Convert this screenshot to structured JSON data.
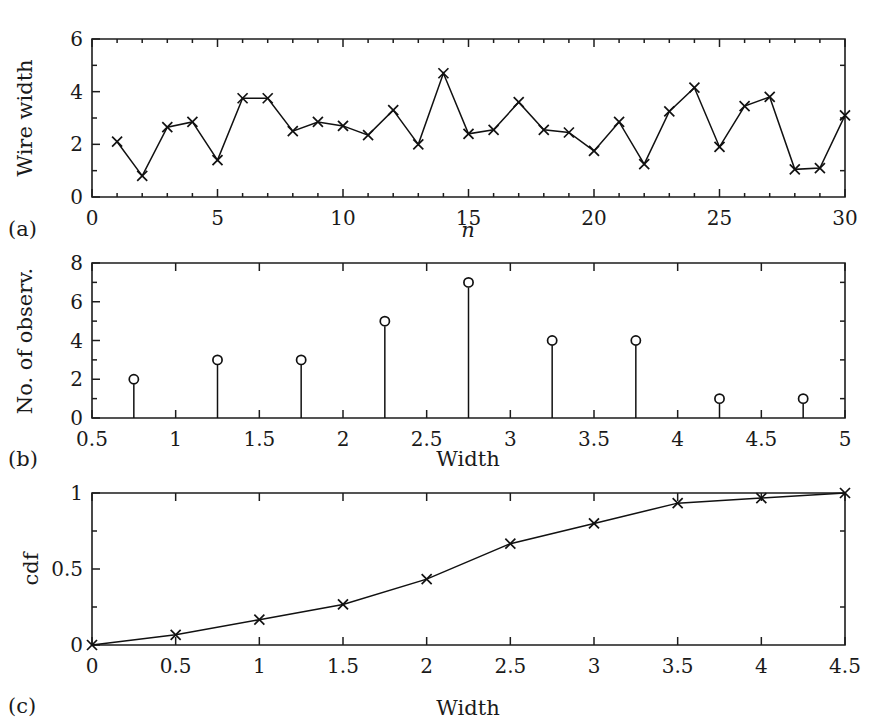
{
  "figure": {
    "title": "",
    "background_color": "#ffffff",
    "line_color": "#111111",
    "axis_color": "#1d1d1d",
    "text_color": "#1a1a1a",
    "panels": [
      {
        "key": "a",
        "label": "(a)"
      },
      {
        "key": "b",
        "label": "(b)"
      },
      {
        "key": "c",
        "label": "(c)"
      }
    ]
  },
  "chart_data": [
    {
      "panel": "a",
      "panel_label": "(a)",
      "type": "line",
      "title": "",
      "xlabel": "n",
      "ylabel": "Wire width",
      "xlim": [
        0,
        30
      ],
      "ylim": [
        0,
        6
      ],
      "xticks": [
        0,
        5,
        10,
        15,
        20,
        25,
        30
      ],
      "xtick_labels": [
        "0",
        "5",
        "10",
        "15",
        "20",
        "25",
        "30"
      ],
      "xminor_step": 1,
      "yticks": [
        0,
        2,
        4,
        6
      ],
      "ytick_labels": [
        "0",
        "2",
        "4",
        "6"
      ],
      "grid": false,
      "legend": false,
      "marker": "x",
      "x": [
        1,
        2,
        3,
        4,
        5,
        6,
        7,
        8,
        9,
        10,
        11,
        12,
        13,
        14,
        15,
        16,
        17,
        18,
        19,
        20,
        21,
        22,
        23,
        24,
        25,
        26,
        27,
        28,
        29,
        30
      ],
      "values": [
        2.1,
        0.8,
        2.65,
        2.85,
        1.4,
        3.75,
        3.75,
        2.5,
        2.85,
        2.7,
        2.35,
        3.3,
        2.0,
        4.7,
        2.4,
        2.55,
        3.6,
        2.55,
        2.45,
        1.75,
        2.85,
        1.25,
        3.25,
        4.15,
        1.9,
        3.45,
        3.8,
        1.05,
        1.1,
        3.1
      ]
    },
    {
      "panel": "b",
      "panel_label": "(b)",
      "type": "bar",
      "subtype": "stem",
      "title": "",
      "xlabel": "Width",
      "ylabel": "No. of observ.",
      "xlim": [
        0.5,
        5
      ],
      "ylim": [
        0,
        8
      ],
      "xticks": [
        0.5,
        1,
        1.5,
        2,
        2.5,
        3,
        3.5,
        4,
        4.5,
        5
      ],
      "xtick_labels": [
        "0.5",
        "1",
        "1.5",
        "2",
        "2.5",
        "3",
        "3.5",
        "4",
        "4.5",
        "5"
      ],
      "yticks": [
        0,
        2,
        4,
        6,
        8
      ],
      "ytick_labels": [
        "0",
        "2",
        "4",
        "6",
        "8"
      ],
      "grid": false,
      "legend": false,
      "marker": "o",
      "categories": [
        0.75,
        1.25,
        1.75,
        2.25,
        2.75,
        3.25,
        3.75,
        4.25,
        4.75
      ],
      "values": [
        2,
        3,
        3,
        5,
        7,
        4,
        4,
        1,
        1
      ]
    },
    {
      "panel": "c",
      "panel_label": "(c)",
      "type": "line",
      "subtype": "cdf",
      "title": "",
      "xlabel": "Width",
      "ylabel": "cdf",
      "xlim": [
        0,
        4.5
      ],
      "ylim": [
        0,
        1
      ],
      "xticks": [
        0,
        0.5,
        1,
        1.5,
        2,
        2.5,
        3,
        3.5,
        4,
        4.5
      ],
      "xtick_labels": [
        "0",
        "0.5",
        "1",
        "1.5",
        "2",
        "2.5",
        "3",
        "3.5",
        "4",
        "4.5"
      ],
      "yticks": [
        0,
        0.5,
        1
      ],
      "ytick_labels": [
        "0",
        "0.5",
        "1"
      ],
      "grid": false,
      "legend": false,
      "marker": "x",
      "x": [
        0,
        0.5,
        1,
        1.5,
        2,
        2.5,
        3,
        3.5,
        4,
        4.5
      ],
      "values": [
        0,
        0.0667,
        0.1667,
        0.2667,
        0.4333,
        0.6667,
        0.8,
        0.9333,
        0.9667,
        1.0
      ]
    }
  ]
}
